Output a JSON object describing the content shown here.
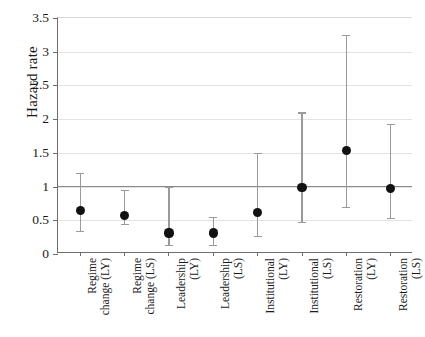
{
  "chart_data": {
    "type": "scatter",
    "title": "",
    "xlabel": "",
    "ylabel": "Hazard rate",
    "ylim": [
      0,
      3.5
    ],
    "ytick_labels": [
      "0",
      "0.5",
      "1",
      "1.5",
      "2",
      "2.5",
      "3",
      "3.5"
    ],
    "ytick_values": [
      0,
      0.5,
      1,
      1.5,
      2,
      2.5,
      3,
      3.5
    ],
    "grid": "horizontal",
    "legend": "none",
    "reference_line": 1,
    "categories": [
      "Regime\nchange (LY)",
      "Regime\nchange (LS)",
      "Leadership\n(LY)",
      "Leadership\n(LS)",
      "Institutional\n(LY)",
      "Institutional\n(LS)",
      "Restoration\n(LY)",
      "Restoration\n(LS)"
    ],
    "values": [
      0.64,
      0.57,
      0.31,
      0.31,
      0.61,
      0.99,
      1.54,
      0.97
    ],
    "ci_low": [
      0.34,
      0.45,
      0.13,
      0.14,
      0.27,
      0.48,
      0.7,
      0.53
    ],
    "ci_high": [
      1.2,
      0.95,
      1.0,
      0.55,
      1.5,
      2.1,
      3.25,
      1.93
    ],
    "series": [
      {
        "name": "Hazard rate estimate",
        "points": [
          {
            "category": "Regime change (LY)",
            "value": 0.64,
            "ci_low": 0.34,
            "ci_high": 1.2
          },
          {
            "category": "Regime change (LS)",
            "value": 0.57,
            "ci_low": 0.45,
            "ci_high": 0.95
          },
          {
            "category": "Leadership (LY)",
            "value": 0.31,
            "ci_low": 0.13,
            "ci_high": 1.0
          },
          {
            "category": "Leadership (LS)",
            "value": 0.31,
            "ci_low": 0.14,
            "ci_high": 0.55
          },
          {
            "category": "Institutional (LY)",
            "value": 0.61,
            "ci_low": 0.27,
            "ci_high": 1.5
          },
          {
            "category": "Institutional (LS)",
            "value": 0.99,
            "ci_low": 0.48,
            "ci_high": 2.1
          },
          {
            "category": "Restoration (LY)",
            "value": 1.54,
            "ci_low": 0.7,
            "ci_high": 3.25
          },
          {
            "category": "Restoration (LS)",
            "value": 0.97,
            "ci_low": 0.53,
            "ci_high": 1.93
          }
        ]
      }
    ],
    "colors": {
      "marker": "#111111",
      "whisker": "#9a9a9a",
      "grid": "#e3e3e3",
      "axis": "#6d6d6d",
      "reference_line": "#8a8a8a",
      "background": "#ffffff"
    }
  }
}
